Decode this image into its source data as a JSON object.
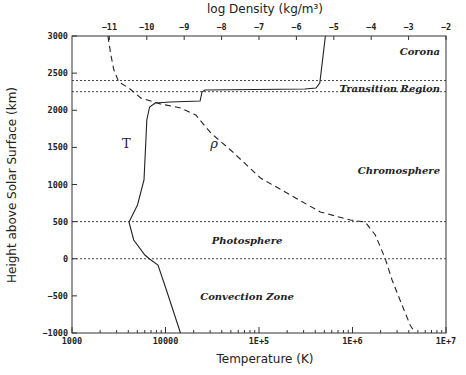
{
  "chart_data": {
    "type": "line",
    "title": "",
    "xlabel": "Temperature (K)",
    "x2label": "log Density (kg/m³)",
    "ylabel": "Height above Solar Surface (km)",
    "xscale": "log",
    "xlim": [
      1000,
      10000000
    ],
    "x2lim": [
      -12,
      -2
    ],
    "ylim": [
      -1000,
      3000
    ],
    "grid": false,
    "x_ticks": [
      {
        "value": 1000,
        "label": "1000"
      },
      {
        "value": 10000,
        "label": "10000"
      },
      {
        "value": 100000,
        "label": "1E+5"
      },
      {
        "value": 1000000,
        "label": "1E+6"
      },
      {
        "value": 10000000,
        "label": "1E+7"
      }
    ],
    "x2_ticks": [
      {
        "value": -11,
        "label": "−11"
      },
      {
        "value": -10,
        "label": "−10"
      },
      {
        "value": -9,
        "label": "−9"
      },
      {
        "value": -8,
        "label": "−8"
      },
      {
        "value": -7,
        "label": "−7"
      },
      {
        "value": -6,
        "label": "−6"
      },
      {
        "value": -5,
        "label": "−5"
      },
      {
        "value": -4,
        "label": "−4"
      },
      {
        "value": -3,
        "label": "−3"
      },
      {
        "value": -2,
        "label": "−2"
      }
    ],
    "y_ticks": [
      {
        "value": 3000,
        "label": "3000"
      },
      {
        "value": 2500,
        "label": "2500"
      },
      {
        "value": 2000,
        "label": "2000"
      },
      {
        "value": 1500,
        "label": "1500"
      },
      {
        "value": 1000,
        "label": "1000"
      },
      {
        "value": 500,
        "label": "500"
      },
      {
        "value": 0,
        "label": "0"
      },
      {
        "value": -500,
        "label": "−500"
      },
      {
        "value": -1000,
        "label": "−1000"
      }
    ],
    "series": [
      {
        "name": "T",
        "axis": "bottom",
        "style": "solid",
        "log10_values": [
          [
            5.71,
            3000
          ],
          [
            5.65,
            2367
          ],
          [
            5.61,
            2300
          ],
          [
            5.49,
            2286
          ],
          [
            4.42,
            2273
          ],
          [
            4.39,
            2246
          ],
          [
            4.37,
            2125
          ],
          [
            4.05,
            2111
          ],
          [
            3.89,
            2098
          ],
          [
            3.83,
            2044
          ],
          [
            3.8,
            1869
          ],
          [
            3.79,
            1600
          ],
          [
            3.77,
            1061
          ],
          [
            3.7,
            724
          ],
          [
            3.61,
            495
          ],
          [
            3.66,
            253
          ],
          [
            3.78,
            51
          ],
          [
            3.83,
            -3
          ],
          [
            3.92,
            -84
          ],
          [
            4.01,
            -421
          ],
          [
            4.16,
            -1000
          ]
        ]
      },
      {
        "name": "ρ",
        "axis": "top",
        "style": "dashed",
        "values": [
          [
            -11.04,
            3000
          ],
          [
            -10.96,
            2744
          ],
          [
            -10.88,
            2542
          ],
          [
            -10.75,
            2380
          ],
          [
            -10.48,
            2300
          ],
          [
            -10.16,
            2165
          ],
          [
            -9.63,
            2084
          ],
          [
            -9.09,
            2030
          ],
          [
            -8.69,
            1936
          ],
          [
            -8.29,
            1693
          ],
          [
            -7.76,
            1465
          ],
          [
            -6.96,
            1088
          ],
          [
            -6.16,
            858
          ],
          [
            -5.36,
            630
          ],
          [
            -4.56,
            522
          ],
          [
            -4.16,
            495
          ],
          [
            -3.89,
            320
          ],
          [
            -3.63,
            10
          ],
          [
            -3.44,
            -286
          ],
          [
            -3.23,
            -556
          ],
          [
            -2.96,
            -892
          ],
          [
            -2.83,
            -1000
          ]
        ]
      }
    ],
    "boundaries": [
      {
        "height": 2400,
        "name": "transition-top"
      },
      {
        "height": 2250,
        "name": "transition-bottom"
      },
      {
        "height": 500,
        "name": "photosphere-top"
      },
      {
        "height": 0,
        "name": "photosphere-bottom"
      }
    ],
    "regions": [
      {
        "label": "Corona",
        "height": 2800,
        "position": "right"
      },
      {
        "label": "Transition Region",
        "height": 2300,
        "position": "right"
      },
      {
        "label": "Chromosphere",
        "height": 1200,
        "position": "right"
      },
      {
        "label": "Photosphere",
        "height": 250,
        "position": "center"
      },
      {
        "label": "Convection Zone",
        "height": -500,
        "position": "center"
      }
    ],
    "curve_labels": [
      {
        "text": "T",
        "log10_x": 3.58,
        "height": 1550
      },
      {
        "text": "ρ",
        "log10_x": 4.52,
        "height": 1550
      }
    ]
  }
}
